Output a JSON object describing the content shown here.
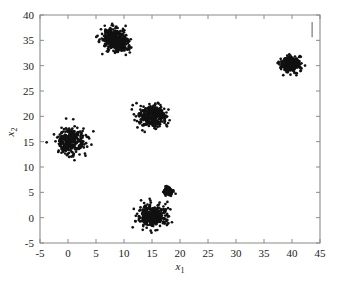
{
  "figure": {
    "background_color": "#ffffff",
    "axes_color": "#8a8a8a",
    "marker_color": "#111111",
    "marker_symbol": "dot"
  },
  "chart_data": {
    "type": "scatter",
    "title": "",
    "xlabel": "x_1",
    "xlabel_base": "x",
    "xlabel_sub": "1",
    "ylabel": "x_2",
    "ylabel_base": "x",
    "ylabel_sub": "2",
    "xlim": [
      -5,
      45
    ],
    "ylim": [
      -5,
      40
    ],
    "xticks": [
      -5,
      0,
      5,
      10,
      15,
      20,
      25,
      30,
      35,
      40,
      45
    ],
    "xticklabels": [
      "-5",
      "0",
      "5",
      "10",
      "15",
      "20",
      "25",
      "30",
      "35",
      "40",
      "45"
    ],
    "yticks": [
      -5,
      0,
      5,
      10,
      15,
      20,
      25,
      30,
      35,
      40
    ],
    "yticklabels": [
      "-5",
      "0",
      "5",
      "10",
      "15",
      "20",
      "25",
      "30",
      "35",
      "40"
    ],
    "grid": false,
    "legend": null,
    "series": [
      {
        "name": "cluster-1",
        "center": [
          0.5,
          15.0
        ],
        "spread": [
          1.25,
          1.3
        ],
        "n": 300,
        "seed": 11
      },
      {
        "name": "cluster-2",
        "center": [
          8.0,
          35.2
        ],
        "spread": [
          1.05,
          1.15
        ],
        "n": 300,
        "seed": 23
      },
      {
        "name": "cluster-2b",
        "center": [
          9.6,
          34.2
        ],
        "spread": [
          0.7,
          0.8
        ],
        "n": 150,
        "seed": 29
      },
      {
        "name": "cluster-3",
        "center": [
          15.2,
          20.0
        ],
        "spread": [
          1.25,
          1.05
        ],
        "n": 320,
        "seed": 37
      },
      {
        "name": "cluster-4",
        "center": [
          39.7,
          30.2
        ],
        "spread": [
          0.82,
          0.85
        ],
        "n": 260,
        "seed": 43
      },
      {
        "name": "cluster-5",
        "center": [
          15.1,
          0.4
        ],
        "spread": [
          1.25,
          1.15
        ],
        "n": 330,
        "seed": 53
      },
      {
        "name": "cluster-6",
        "center": [
          17.9,
          5.2
        ],
        "spread": [
          0.42,
          0.4
        ],
        "n": 110,
        "seed": 67
      }
    ],
    "annotations": [
      {
        "name": "top-right-tick-artifact",
        "type": "vertical-line",
        "x": 43.6,
        "y_start": 38.6,
        "y_end": 35.6
      }
    ]
  }
}
